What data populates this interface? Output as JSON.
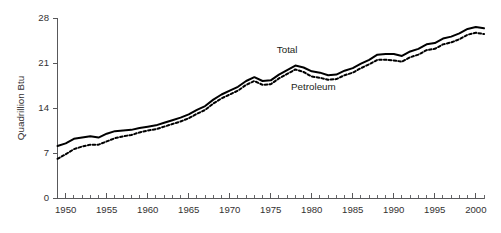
{
  "chart_data": {
    "type": "line",
    "title": "",
    "xlabel": "",
    "ylabel": "Quadrillion Btu",
    "xlim": [
      1949,
      2001
    ],
    "ylim": [
      0,
      28
    ],
    "yticks": [
      0,
      7,
      14,
      21,
      28
    ],
    "ytick_labels": [
      "0",
      "7",
      "14",
      "21",
      "28"
    ],
    "xticks": [
      1950,
      1955,
      1960,
      1965,
      1970,
      1975,
      1980,
      1985,
      1990,
      1995,
      2000
    ],
    "xtick_labels": [
      "1950",
      "1955",
      "1960",
      "1965",
      "1970",
      "1975",
      "1980",
      "1985",
      "1990",
      "1995",
      "2000"
    ],
    "minor_xticks_every": 1,
    "grid": false,
    "legend_position": "inline-annotations",
    "x": [
      1949,
      1950,
      1951,
      1952,
      1953,
      1954,
      1955,
      1956,
      1957,
      1958,
      1959,
      1960,
      1961,
      1962,
      1963,
      1964,
      1965,
      1966,
      1967,
      1968,
      1969,
      1970,
      1971,
      1972,
      1973,
      1974,
      1975,
      1976,
      1977,
      1978,
      1979,
      1980,
      1981,
      1982,
      1983,
      1984,
      1985,
      1986,
      1987,
      1988,
      1989,
      1990,
      1991,
      1992,
      1993,
      1994,
      1995,
      1996,
      1997,
      1998,
      1999,
      2000,
      2001
    ],
    "series": [
      {
        "name": "Total",
        "style": "solid",
        "color": "#000000",
        "annotation": "Total",
        "annotation_x": 1977.0,
        "annotation_y": 22.6,
        "values": [
          8.1,
          8.5,
          9.2,
          9.4,
          9.6,
          9.4,
          10.0,
          10.4,
          10.5,
          10.6,
          10.9,
          11.1,
          11.3,
          11.7,
          12.1,
          12.5,
          13.0,
          13.7,
          14.3,
          15.3,
          16.1,
          16.7,
          17.3,
          18.2,
          18.8,
          18.2,
          18.3,
          19.2,
          19.9,
          20.6,
          20.3,
          19.7,
          19.5,
          19.1,
          19.2,
          19.8,
          20.2,
          20.9,
          21.5,
          22.3,
          22.4,
          22.4,
          22.1,
          22.8,
          23.2,
          23.9,
          24.1,
          24.8,
          25.1,
          25.6,
          26.3,
          26.6,
          26.4
        ]
      },
      {
        "name": "Petroleum",
        "style": "dashed",
        "color": "#000000",
        "annotation": "Petroleum",
        "annotation_x": 1980.2,
        "annotation_y": 16.8,
        "values": [
          6.1,
          6.8,
          7.6,
          8.0,
          8.3,
          8.3,
          8.8,
          9.3,
          9.6,
          9.8,
          10.2,
          10.5,
          10.7,
          11.1,
          11.5,
          11.9,
          12.4,
          13.1,
          13.7,
          14.7,
          15.5,
          16.1,
          16.7,
          17.6,
          18.2,
          17.6,
          17.7,
          18.6,
          19.3,
          20.0,
          19.6,
          18.9,
          18.7,
          18.4,
          18.5,
          19.1,
          19.5,
          20.2,
          20.8,
          21.5,
          21.5,
          21.4,
          21.2,
          21.9,
          22.3,
          23.0,
          23.2,
          23.9,
          24.2,
          24.7,
          25.4,
          25.7,
          25.5
        ]
      }
    ]
  },
  "axis": {
    "y_title": "Quadrillion Btu"
  }
}
